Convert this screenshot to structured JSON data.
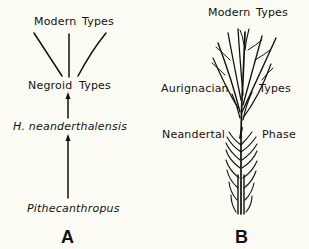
{
  "colors": {
    "background": "#fdfcf4",
    "ink": "#111111"
  },
  "diagram_a": {
    "panel_label": "A",
    "labels": {
      "modern_left": "Modern",
      "modern_right": "Types",
      "negroid_left": "Negroid",
      "negroid_right": "Types",
      "neanderthalensis": "H. neanderthalensis",
      "pithecanthropus": "Pithecanthropus"
    },
    "arrows": [
      {
        "from": "Pithecanthropus",
        "to": "H. neanderthalensis"
      },
      {
        "from": "H. neanderthalensis",
        "to": "Negroid Types"
      }
    ],
    "branches": [
      "left",
      "center",
      "right"
    ]
  },
  "diagram_b": {
    "panel_label": "B",
    "labels": {
      "modern_left": "Modern",
      "modern_right": "Types",
      "aurignacian_left": "Aurignacian",
      "aurignacian_right": "Types",
      "neandertal_left": "Neandertal",
      "neandertal_right": "Phase"
    }
  }
}
